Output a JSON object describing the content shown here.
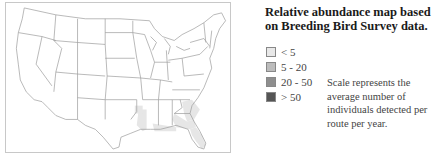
{
  "title": "Relative abundance map based on Breeding Bird Survey data.",
  "legend": {
    "items": [
      {
        "label": "< 5",
        "color": "#e8e8e8"
      },
      {
        "label": "5 - 20",
        "color": "#bcbcbc"
      },
      {
        "label": "20 - 50",
        "color": "#8e8e8e"
      },
      {
        "label": "> 50",
        "color": "#555555"
      }
    ]
  },
  "note": "Scale represents the average number of individuals detected per route per year.",
  "map": {
    "region": "Contiguous United States",
    "boundary_color": "#9a9a9a",
    "shaded_regions": [
      "South Carolina",
      "Georgia",
      "Florida",
      "Gulf Coast of Alabama",
      "Gulf Coast of Mississippi",
      "Louisiana",
      "East Texas"
    ],
    "shade_color": "#e8e8e8"
  }
}
